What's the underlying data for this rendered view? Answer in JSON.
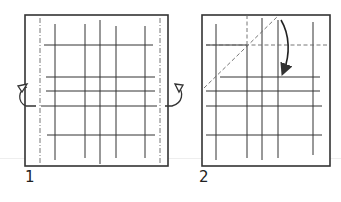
{
  "figure": {
    "colors": {
      "line": "#333333",
      "paper": "#ffffff",
      "fold": "#555555"
    }
  },
  "steps": [
    {
      "number": "1",
      "label_pos": [
        26,
        186
      ],
      "square": {
        "x": 25,
        "y": 15,
        "w": 143,
        "h": 151
      },
      "mountain_folds_vertical": [
        40,
        160
      ],
      "grid_vertical": [
        {
          "x": 55,
          "y1": 24,
          "y2": 160
        },
        {
          "x": 85,
          "y1": 24,
          "y2": 158
        },
        {
          "x": 100,
          "y1": 20,
          "y2": 164
        },
        {
          "x": 116,
          "y1": 26,
          "y2": 158
        },
        {
          "x": 145,
          "y1": 26,
          "y2": 158
        }
      ],
      "grid_horizontal": [
        {
          "y": 45,
          "x1": 44,
          "x2": 153
        },
        {
          "y": 77,
          "x1": 46,
          "x2": 155
        },
        {
          "y": 91,
          "x1": 46,
          "x2": 155
        },
        {
          "y": 106,
          "x1": 41,
          "x2": 157
        },
        {
          "y": 135,
          "x1": 47,
          "x2": 155
        }
      ],
      "arrows": [
        "rotate-back-left",
        "rotate-back-right"
      ]
    },
    {
      "number": "2",
      "label_pos": [
        200,
        186
      ],
      "square": {
        "x": 202,
        "y": 15,
        "w": 128,
        "h": 151
      },
      "valley_fold_diagonal": {
        "x1": 204,
        "y1": 88,
        "x2": 278,
        "y2": 16
      },
      "valley_fold_horizontal": {
        "y": 45,
        "x1": 206,
        "x2": 328
      },
      "valley_fold_vertical": {
        "x": 247,
        "y1": 15,
        "y2": 45
      },
      "grid_vertical": [
        {
          "x": 216,
          "y1": 24,
          "y2": 160
        },
        {
          "x": 247,
          "y1": 45,
          "y2": 158
        },
        {
          "x": 262,
          "y1": 18,
          "y2": 160
        },
        {
          "x": 278,
          "y1": 20,
          "y2": 158
        },
        {
          "x": 313,
          "y1": 22,
          "y2": 155
        }
      ],
      "grid_horizontal": [
        {
          "y": 45,
          "x1": 206,
          "x2": 247
        },
        {
          "y": 77,
          "x1": 220,
          "x2": 320
        },
        {
          "y": 91,
          "x1": 206,
          "x2": 320
        },
        {
          "y": 106,
          "x1": 206,
          "x2": 322
        },
        {
          "y": 135,
          "x1": 206,
          "x2": 322
        }
      ],
      "arrows": [
        "fold-down-corner"
      ]
    }
  ]
}
